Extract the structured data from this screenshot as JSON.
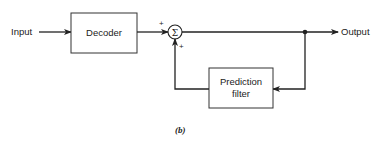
{
  "diagram": {
    "input_label": "Input",
    "output_label": "Output",
    "blocks": [
      {
        "id": "decoder",
        "label_lines": [
          "Decoder"
        ]
      },
      {
        "id": "prediction-filter",
        "label_lines": [
          "Prediction",
          "filter"
        ]
      }
    ],
    "summer": {
      "symbol": "Σ",
      "input_signs": [
        "+",
        "+"
      ]
    },
    "caption": "(b)"
  },
  "colors": {
    "line": "#222222",
    "background": "#ffffff"
  }
}
